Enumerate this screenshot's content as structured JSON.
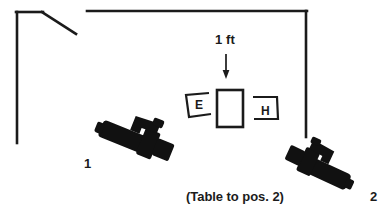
{
  "diagram": {
    "colors": {
      "ink": "#1b1b1b",
      "wall": "#1b1b1b",
      "background": "#ffffff",
      "silhouette": "#111111"
    },
    "labels": {
      "dimension": "1 ft",
      "camera_1": "1",
      "camera_2": "2",
      "caption": "(Table to pos. 2)",
      "box_e": "E",
      "box_h": "H"
    },
    "elements": {
      "wall_left": "wall-left",
      "wall_top": "wall-top",
      "wall_right": "wall-right",
      "wall_diagonal": "wall-diagonal",
      "table": "table-rectangle",
      "box_e": "open-box-e",
      "box_h": "open-box-h",
      "arrow": "dimension-arrow-down",
      "camera_1": "camera-silhouette-1",
      "camera_2": "camera-silhouette-2"
    }
  }
}
